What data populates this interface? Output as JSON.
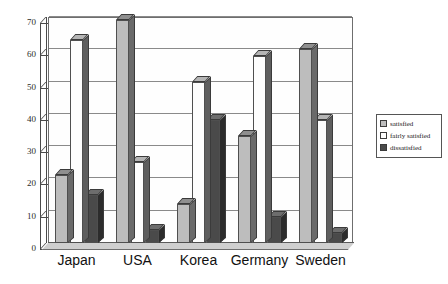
{
  "chart_data": {
    "type": "bar",
    "title": "",
    "subtitle": "",
    "xlabel": "",
    "ylabel": "",
    "categories": [
      "Japan",
      "USA",
      "Korea",
      "Germany",
      "Sweden"
    ],
    "series": [
      {
        "name": "satisfied",
        "color": "#bdbdbd",
        "values": [
          21,
          69,
          12,
          33,
          60
        ]
      },
      {
        "name": "fairly satisfied",
        "color": "#fdfdfd",
        "values": [
          63,
          25,
          50,
          58,
          38
        ]
      },
      {
        "name": "dissatisfied",
        "color": "#4a4a4a",
        "values": [
          15,
          4,
          38,
          8,
          3
        ]
      }
    ],
    "ylim": [
      0,
      70
    ],
    "yticks": [
      0,
      10,
      20,
      30,
      40,
      50,
      60,
      70
    ],
    "ytick_labels": [
      "0",
      "10",
      "20",
      "30",
      "40",
      "50",
      "60",
      "70"
    ],
    "grid": true,
    "legend_position": "right",
    "style": "3d-bar"
  },
  "legend": {
    "items": [
      {
        "label": "satisfied"
      },
      {
        "label": "fairly satisfied"
      },
      {
        "label": "dissatisfied"
      }
    ]
  }
}
